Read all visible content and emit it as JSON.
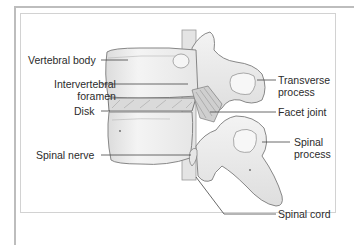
{
  "diagram": {
    "type": "anatomical-illustration",
    "labels_left": [
      {
        "id": "vertebral-body",
        "lines": [
          "Vertebral body"
        ]
      },
      {
        "id": "intervertebral-foramen",
        "lines": [
          "Intervertebral",
          "foramen"
        ]
      },
      {
        "id": "disk",
        "lines": [
          "Disk"
        ]
      },
      {
        "id": "spinal-nerve",
        "lines": [
          "Spinal nerve"
        ]
      }
    ],
    "labels_right": [
      {
        "id": "transverse-process",
        "lines": [
          "Transverse",
          "process"
        ]
      },
      {
        "id": "facet-joint",
        "lines": [
          "Facet joint"
        ]
      },
      {
        "id": "spinal-process",
        "lines": [
          "Spinal",
          "process"
        ]
      },
      {
        "id": "spinal-cord",
        "lines": [
          "Spinal cord"
        ]
      }
    ]
  },
  "colors": {
    "bone_fill": "#ededed",
    "bone_stroke": "#7a7a7a",
    "leader_line": "#444444",
    "label_text": "#2b2b2b",
    "frame": "#bdbdbd"
  }
}
